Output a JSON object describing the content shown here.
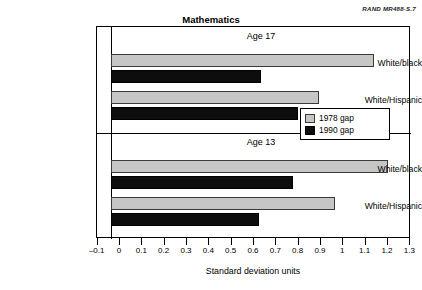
{
  "credit": "RAND MR488-S.7",
  "chart_data": {
    "type": "bar",
    "orientation": "horizontal",
    "title": "Mathematics",
    "xlabel": "Standard deviation units",
    "ylabel": "",
    "xlim": [
      -0.1,
      1.3
    ],
    "xticks": [
      "–0.1",
      "0",
      "0.1",
      "0.2",
      "0.3",
      "0.4",
      "0.5",
      "0.6",
      "0.7",
      "0.8",
      "0.9",
      "1",
      "1.1",
      "1.2",
      "1.3"
    ],
    "xtick_values": [
      -0.1,
      0,
      0.1,
      0.2,
      0.3,
      0.4,
      0.5,
      0.6,
      0.7,
      0.8,
      0.9,
      1.0,
      1.1,
      1.2,
      1.3
    ],
    "grid": false,
    "legend_position": "center-right",
    "legend": [
      {
        "name": "1978 gap",
        "color": "#c6c6c6"
      },
      {
        "name": "1990 gap",
        "color": "#0d0d0d"
      }
    ],
    "panels": [
      {
        "label": "Age 17",
        "categories": [
          "White/black",
          "White/Hispanic"
        ],
        "series": [
          {
            "name": "1978 gap",
            "values": [
              1.14,
              0.9
            ]
          },
          {
            "name": "1990 gap",
            "values": [
              0.65,
              0.81
            ]
          }
        ]
      },
      {
        "label": "Age 13",
        "categories": [
          "White/black",
          "White/Hispanic"
        ],
        "series": [
          {
            "name": "1978 gap",
            "values": [
              1.2,
              0.97
            ]
          },
          {
            "name": "1990 gap",
            "values": [
              0.79,
              0.64
            ]
          }
        ]
      }
    ]
  }
}
